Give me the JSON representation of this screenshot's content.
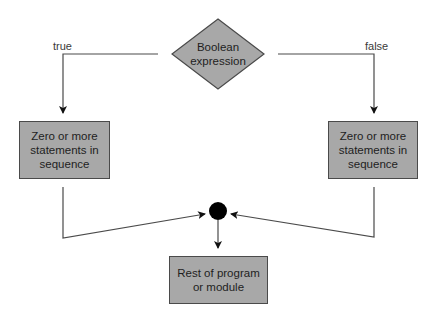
{
  "diagram": {
    "type": "flowchart",
    "colors": {
      "node_fill": "#a8a8a8",
      "node_border": "#4a4a4a",
      "line": "#4a4a4a",
      "arrow": "#111111",
      "junction": "#000000",
      "text": "#1e1e1e"
    },
    "nodes": {
      "decision": {
        "shape": "diamond",
        "line1": "Boolean",
        "line2": "expression"
      },
      "true_branch": {
        "shape": "rectangle",
        "line1": "Zero or more",
        "line2": "statements in",
        "line3": "sequence"
      },
      "false_branch": {
        "shape": "rectangle",
        "line1": "Zero or more",
        "line2": "statements in",
        "line3": "sequence"
      },
      "junction": {
        "shape": "circle"
      },
      "rest": {
        "shape": "rectangle",
        "line1": "Rest of program",
        "line2": "or module"
      }
    },
    "edge_labels": {
      "true": "true",
      "false": "false"
    },
    "edges": [
      {
        "from": "decision",
        "to": "true_branch",
        "label": "true"
      },
      {
        "from": "decision",
        "to": "false_branch",
        "label": "false"
      },
      {
        "from": "true_branch",
        "to": "junction"
      },
      {
        "from": "false_branch",
        "to": "junction"
      },
      {
        "from": "junction",
        "to": "rest"
      }
    ]
  }
}
